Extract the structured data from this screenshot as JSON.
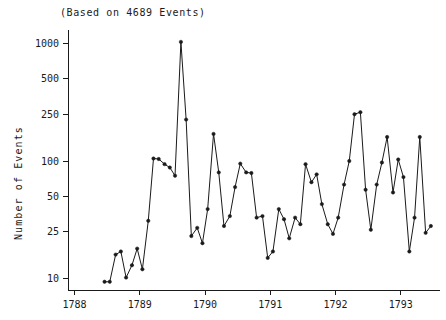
{
  "chart_data": {
    "type": "line",
    "title": "(Based on 4689 Events)",
    "xlabel": "",
    "ylabel": "Number of Events",
    "yscale": "log",
    "ylim": [
      8,
      1300
    ],
    "xlim": [
      1787.9,
      1793.6
    ],
    "grid": false,
    "legend": null,
    "marker": "filled-circle",
    "y_ticks": [
      10,
      25,
      50,
      100,
      250,
      500,
      1000
    ],
    "y_tick_labels": [
      "10",
      "25",
      "50",
      "100",
      "250",
      "500",
      "1000"
    ],
    "x_ticks": [
      1788,
      1789,
      1790,
      1791,
      1792,
      1793
    ],
    "x_tick_labels": [
      "1788",
      "1789",
      "1790",
      "1791",
      "1792",
      "1793"
    ],
    "x": [
      1788.46,
      1788.54,
      1788.63,
      1788.71,
      1788.79,
      1788.88,
      1788.96,
      1789.04,
      1789.13,
      1789.21,
      1789.29,
      1789.38,
      1789.46,
      1789.54,
      1789.63,
      1789.71,
      1789.79,
      1789.88,
      1789.96,
      1790.04,
      1790.13,
      1790.21,
      1790.29,
      1790.38,
      1790.46,
      1790.54,
      1790.63,
      1790.71,
      1790.79,
      1790.88,
      1790.96,
      1791.04,
      1791.13,
      1791.21,
      1791.29,
      1791.38,
      1791.46,
      1791.54,
      1791.63,
      1791.71,
      1791.79,
      1791.88,
      1791.96,
      1792.04,
      1792.13,
      1792.21,
      1792.29,
      1792.38,
      1792.46,
      1792.54,
      1792.63,
      1792.71,
      1792.79,
      1792.88,
      1792.96,
      1793.04,
      1793.13,
      1793.21,
      1793.29,
      1793.38,
      1793.46
    ],
    "values": [
      9.4,
      9.4,
      16,
      17,
      10.2,
      13,
      18,
      12,
      31,
      105,
      104,
      94,
      88,
      75,
      1030,
      225,
      23,
      27,
      20,
      39,
      170,
      80,
      28,
      34,
      60,
      95,
      80,
      79,
      33,
      34,
      15,
      17,
      39,
      32,
      22,
      33,
      29,
      94,
      66,
      77,
      43,
      29,
      24,
      33,
      63,
      100,
      250,
      260,
      57,
      26,
      63,
      97,
      160,
      54,
      103,
      73,
      17,
      33,
      160,
      24.5,
      28
    ],
    "n_points": 61,
    "n_events_total": 4689
  },
  "axes": {
    "y_title": "Number of Events"
  }
}
